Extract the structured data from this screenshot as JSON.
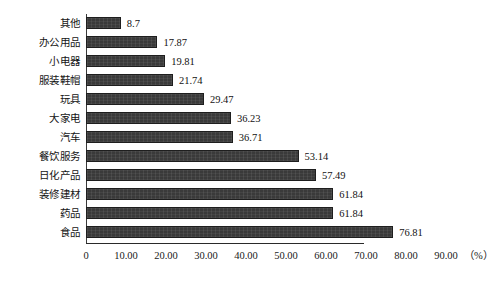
{
  "chart_data": {
    "type": "bar",
    "orientation": "horizontal",
    "title": "",
    "xlabel": "（%）",
    "ylabel": "",
    "xlim": [
      0,
      90
    ],
    "grid": false,
    "legend": null,
    "categories": [
      "其他",
      "办公用品",
      "小电器",
      "服装鞋帽",
      "玩具",
      "大家电",
      "汽车",
      "餐饮服务",
      "日化产品",
      "装修建材",
      "药品",
      "食品"
    ],
    "values": [
      8.7,
      17.87,
      19.81,
      21.74,
      29.47,
      36.23,
      36.71,
      53.14,
      57.49,
      61.84,
      61.84,
      76.81
    ],
    "value_labels": [
      "8.7",
      "17.87",
      "19.81",
      "21.74",
      "29.47",
      "36.23",
      "36.71",
      "53.14",
      "57.49",
      "61.84",
      "61.84",
      "76.81"
    ],
    "xticks": [
      0,
      10,
      20,
      30,
      40,
      50,
      60,
      70,
      80,
      90
    ],
    "xtick_labels": [
      "0",
      "10.00",
      "20.00",
      "30.00",
      "40.00",
      "50.00",
      "60.00",
      "70.00",
      "80.00",
      "90.00"
    ],
    "unit_label": "（%）",
    "bar_color": "#3a3a3a",
    "axis_color": "#2a2a2a",
    "background_color": "#ffffff"
  }
}
